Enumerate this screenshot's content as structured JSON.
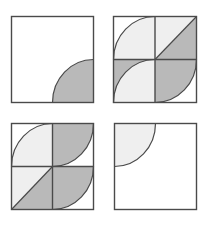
{
  "colors": {
    "background": "#ffffff",
    "stroke": "#4a4a4a",
    "light_fill": "#efefef",
    "dark_fill": "#b9b9b9",
    "white_fill": "#ffffff"
  },
  "panels": [
    {
      "name": "panel-top-left",
      "grid": 1,
      "cells": [
        {
          "shape": "quarter-circle",
          "center": "bottom-right",
          "radius_fraction": 0.5,
          "shape_fill": "dark",
          "cell_fill": "white"
        }
      ]
    },
    {
      "name": "panel-top-right",
      "grid": 2,
      "cells": [
        {
          "shape": "quarter-circle",
          "center": "bottom-right",
          "radius_fraction": 1,
          "shape_fill": "light",
          "cell_fill": "white"
        },
        {
          "shape": "diagonal",
          "from": "bottom-left",
          "to": "top-right",
          "upper_fill": "light",
          "lower_fill": "dark"
        },
        {
          "shape": "quarter-circle",
          "center": "bottom-right",
          "radius_fraction": 1,
          "shape_fill": "light",
          "cell_fill": "dark"
        },
        {
          "shape": "quarter-circle",
          "center": "top-left",
          "radius_fraction": 1,
          "shape_fill": "dark",
          "cell_fill": "white"
        }
      ]
    },
    {
      "name": "panel-bottom-left",
      "grid": 2,
      "cells": [
        {
          "shape": "quarter-circle",
          "center": "bottom-right",
          "radius_fraction": 1,
          "shape_fill": "light",
          "cell_fill": "white"
        },
        {
          "shape": "quarter-circle",
          "center": "top-left",
          "radius_fraction": 1,
          "shape_fill": "dark",
          "cell_fill": "white"
        },
        {
          "shape": "diagonal",
          "from": "bottom-left",
          "to": "top-right",
          "upper_fill": "light",
          "lower_fill": "dark"
        },
        {
          "shape": "quarter-circle",
          "center": "top-left",
          "radius_fraction": 1,
          "shape_fill": "dark",
          "cell_fill": "white"
        }
      ]
    },
    {
      "name": "panel-bottom-right",
      "grid": 1,
      "cells": [
        {
          "shape": "quarter-circle",
          "center": "top-left",
          "radius_fraction": 0.5,
          "shape_fill": "light",
          "cell_fill": "white"
        }
      ]
    }
  ]
}
